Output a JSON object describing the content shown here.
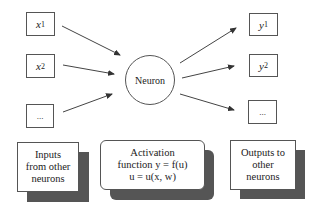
{
  "diagram": {
    "inputs": [
      {
        "symbol": "x",
        "subscript": "1"
      },
      {
        "symbol": "x",
        "subscript": "2"
      },
      {
        "symbol": "...",
        "subscript": ""
      }
    ],
    "neuron": {
      "label": "Neuron"
    },
    "outputs": [
      {
        "symbol": "y",
        "subscript": "1"
      },
      {
        "symbol": "y",
        "subscript": "2"
      },
      {
        "symbol": "...",
        "subscript": ""
      }
    ],
    "captions": {
      "inputs": {
        "lines": [
          "Inputs",
          "from other",
          "neurons"
        ]
      },
      "activation": {
        "lines": [
          "Activation",
          "function y = f(u)",
          "u = u(x, w)"
        ]
      },
      "outputs": {
        "lines": [
          "Outputs to",
          "other",
          "neurons"
        ]
      }
    },
    "colors": {
      "stroke": "#555555",
      "shadow": "#555555",
      "background": "#ffffff"
    }
  }
}
